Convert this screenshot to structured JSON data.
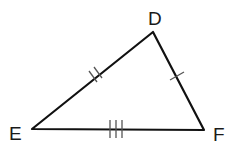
{
  "diagram": {
    "type": "triangle",
    "vertices": [
      {
        "label": "D",
        "x": 153,
        "y": 32,
        "label_x": 148,
        "label_y": 25
      },
      {
        "label": "E",
        "x": 32,
        "y": 129,
        "label_x": 9,
        "label_y": 140
      },
      {
        "label": "F",
        "x": 204,
        "y": 130,
        "label_x": 213,
        "label_y": 141
      }
    ],
    "sides": [
      {
        "name": "DE",
        "tick_marks": 2
      },
      {
        "name": "DF",
        "tick_marks": 1
      },
      {
        "name": "EF",
        "tick_marks": 3
      }
    ],
    "colors": {
      "line": "#111111",
      "tick": "#555555",
      "background": "#ffffff"
    }
  }
}
